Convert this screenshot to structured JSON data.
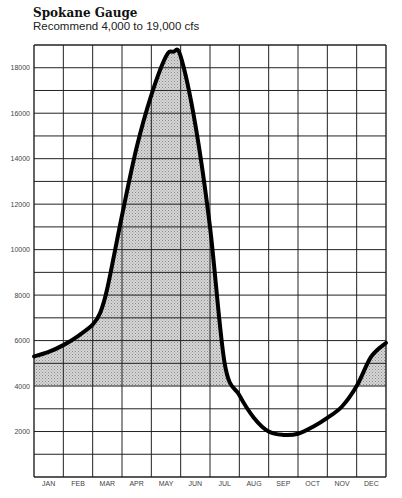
{
  "header": {
    "title": "Spokane Gauge",
    "subtitle": "Recommend 4,000 to 19,000 cfs"
  },
  "chart_data": {
    "type": "area",
    "title": "Spokane Gauge",
    "subtitle": "Recommend 4,000 to 19,000 cfs",
    "xlabel": "",
    "ylabel": "cfs",
    "categories": [
      "JAN",
      "FEB",
      "MAR",
      "APR",
      "MAY",
      "JUN",
      "JUL",
      "AUG",
      "SEP",
      "OCT",
      "NOV",
      "DEC"
    ],
    "y_tick_labels": [
      "2000",
      "4000",
      "6000",
      "8000",
      "10000",
      "12000",
      "14000",
      "16000",
      "18000"
    ],
    "ylim": [
      0,
      19000
    ],
    "grid": true,
    "recommended_range": [
      4000,
      19000
    ],
    "series": [
      {
        "name": "Flow (cfs)",
        "x": [
          0,
          0.5,
          1,
          1.5,
          2,
          2.25,
          2.5,
          3,
          3.5,
          4,
          4.5,
          4.75,
          5,
          5.5,
          6,
          6.5,
          7,
          7.5,
          8,
          8.5,
          9,
          9.5,
          10,
          10.5,
          11,
          11.5,
          12
        ],
        "values": [
          5300,
          5500,
          5800,
          6200,
          6700,
          7200,
          8300,
          11500,
          14500,
          16800,
          18500,
          18700,
          18500,
          15500,
          11000,
          5000,
          3600,
          2600,
          2000,
          1850,
          1900,
          2200,
          2600,
          3100,
          4000,
          5300,
          5900
        ]
      }
    ],
    "shading": "area under curve shaded only where flow is within recommended range (>= 4000)"
  }
}
